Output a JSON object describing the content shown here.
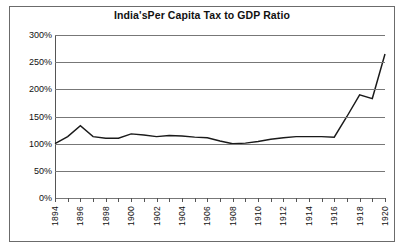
{
  "chart_data": {
    "type": "line",
    "title": "India'sPer Capita Tax to GDP Ratio",
    "xlabel": "",
    "ylabel": "",
    "grid": true,
    "legend": false,
    "ylim": [
      0,
      300
    ],
    "xlim": [
      1894,
      1920
    ],
    "ytick_labels": [
      "300%",
      "250%",
      "200%",
      "150%",
      "100%",
      "50%",
      "0%"
    ],
    "ytick_values": [
      300,
      250,
      200,
      150,
      100,
      50,
      0
    ],
    "xtick_labels": [
      "1894",
      "1896",
      "1898",
      "1900",
      "1902",
      "1904",
      "1906",
      "1908",
      "1910",
      "1912",
      "1914",
      "1916",
      "1918",
      "1920"
    ],
    "xtick_values": [
      1894,
      1896,
      1898,
      1900,
      1902,
      1904,
      1906,
      1908,
      1910,
      1912,
      1914,
      1916,
      1918,
      1920
    ],
    "x": [
      1894,
      1895,
      1896,
      1897,
      1898,
      1899,
      1900,
      1901,
      1902,
      1903,
      1904,
      1905,
      1906,
      1907,
      1908,
      1909,
      1910,
      1911,
      1912,
      1913,
      1914,
      1915,
      1916,
      1917,
      1918,
      1919,
      1920
    ],
    "values": [
      100,
      113,
      133,
      113,
      110,
      110,
      118,
      116,
      113,
      115,
      114,
      112,
      111,
      105,
      100,
      101,
      104,
      108,
      111,
      113,
      113,
      113,
      112,
      150,
      190,
      183,
      265
    ],
    "series": [
      {
        "name": "Per Capita Tax to GDP Ratio",
        "color": "#1a1a1a",
        "values": [
          100,
          113,
          133,
          113,
          110,
          110,
          118,
          116,
          113,
          115,
          114,
          112,
          111,
          105,
          100,
          101,
          104,
          108,
          111,
          113,
          113,
          113,
          112,
          150,
          190,
          183,
          265
        ]
      }
    ]
  }
}
